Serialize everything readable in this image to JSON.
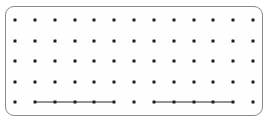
{
  "figure": {
    "title": "",
    "panel": {
      "x": 5,
      "y": 6,
      "width": 258,
      "height": 110,
      "corner_radius": 9,
      "background_color": "#fefefe",
      "border_color": "#8a8a8a",
      "border_width": 1
    },
    "dot_color": "#1c1c1c",
    "dot_size": 3,
    "edge_color": "#2a2a2a",
    "edge_width": 1
  },
  "chart_data": {
    "type": "scatter",
    "title": "",
    "xlabel": "",
    "ylabel": "",
    "grid": false,
    "legend": null,
    "rows": 5,
    "columns": 13,
    "x_start": 15,
    "x_step": 19.83,
    "y_start": 20,
    "y_step": 20.5,
    "points": [
      {
        "row": 1,
        "col": 1,
        "x": 15.0,
        "y": 20
      },
      {
        "row": 1,
        "col": 2,
        "x": 34.8,
        "y": 20
      },
      {
        "row": 1,
        "col": 3,
        "x": 54.7,
        "y": 20
      },
      {
        "row": 1,
        "col": 4,
        "x": 74.5,
        "y": 20
      },
      {
        "row": 1,
        "col": 5,
        "x": 94.3,
        "y": 20
      },
      {
        "row": 1,
        "col": 6,
        "x": 114.2,
        "y": 20
      },
      {
        "row": 1,
        "col": 7,
        "x": 134.0,
        "y": 20
      },
      {
        "row": 1,
        "col": 8,
        "x": 153.8,
        "y": 20
      },
      {
        "row": 1,
        "col": 9,
        "x": 173.6,
        "y": 20
      },
      {
        "row": 1,
        "col": 10,
        "x": 193.5,
        "y": 20
      },
      {
        "row": 1,
        "col": 11,
        "x": 213.3,
        "y": 20
      },
      {
        "row": 1,
        "col": 12,
        "x": 233.1,
        "y": 20
      },
      {
        "row": 1,
        "col": 13,
        "x": 253.0,
        "y": 20
      },
      {
        "row": 2,
        "col": 1,
        "x": 15.0,
        "y": 40.5
      },
      {
        "row": 2,
        "col": 2,
        "x": 34.8,
        "y": 40.5
      },
      {
        "row": 2,
        "col": 3,
        "x": 54.7,
        "y": 40.5
      },
      {
        "row": 2,
        "col": 4,
        "x": 74.5,
        "y": 40.5
      },
      {
        "row": 2,
        "col": 5,
        "x": 94.3,
        "y": 40.5
      },
      {
        "row": 2,
        "col": 6,
        "x": 114.2,
        "y": 40.5
      },
      {
        "row": 2,
        "col": 7,
        "x": 134.0,
        "y": 40.5
      },
      {
        "row": 2,
        "col": 8,
        "x": 153.8,
        "y": 40.5
      },
      {
        "row": 2,
        "col": 9,
        "x": 173.6,
        "y": 40.5
      },
      {
        "row": 2,
        "col": 10,
        "x": 193.5,
        "y": 40.5
      },
      {
        "row": 2,
        "col": 11,
        "x": 213.3,
        "y": 40.5
      },
      {
        "row": 2,
        "col": 12,
        "x": 233.1,
        "y": 40.5
      },
      {
        "row": 2,
        "col": 13,
        "x": 253.0,
        "y": 40.5
      },
      {
        "row": 3,
        "col": 1,
        "x": 15.0,
        "y": 61
      },
      {
        "row": 3,
        "col": 2,
        "x": 34.8,
        "y": 61
      },
      {
        "row": 3,
        "col": 3,
        "x": 54.7,
        "y": 61
      },
      {
        "row": 3,
        "col": 4,
        "x": 74.5,
        "y": 61
      },
      {
        "row": 3,
        "col": 5,
        "x": 94.3,
        "y": 61
      },
      {
        "row": 3,
        "col": 6,
        "x": 114.2,
        "y": 61
      },
      {
        "row": 3,
        "col": 7,
        "x": 134.0,
        "y": 61
      },
      {
        "row": 3,
        "col": 8,
        "x": 153.8,
        "y": 61
      },
      {
        "row": 3,
        "col": 9,
        "x": 173.6,
        "y": 61
      },
      {
        "row": 3,
        "col": 10,
        "x": 193.5,
        "y": 61
      },
      {
        "row": 3,
        "col": 11,
        "x": 213.3,
        "y": 61
      },
      {
        "row": 3,
        "col": 12,
        "x": 233.1,
        "y": 61
      },
      {
        "row": 3,
        "col": 13,
        "x": 253.0,
        "y": 61
      },
      {
        "row": 4,
        "col": 1,
        "x": 15.0,
        "y": 81.5
      },
      {
        "row": 4,
        "col": 2,
        "x": 34.8,
        "y": 81.5
      },
      {
        "row": 4,
        "col": 3,
        "x": 54.7,
        "y": 81.5
      },
      {
        "row": 4,
        "col": 4,
        "x": 74.5,
        "y": 81.5
      },
      {
        "row": 4,
        "col": 5,
        "x": 94.3,
        "y": 81.5
      },
      {
        "row": 4,
        "col": 6,
        "x": 114.2,
        "y": 81.5
      },
      {
        "row": 4,
        "col": 7,
        "x": 134.0,
        "y": 81.5
      },
      {
        "row": 4,
        "col": 8,
        "x": 153.8,
        "y": 81.5
      },
      {
        "row": 4,
        "col": 9,
        "x": 173.6,
        "y": 81.5
      },
      {
        "row": 4,
        "col": 10,
        "x": 193.5,
        "y": 81.5
      },
      {
        "row": 4,
        "col": 11,
        "x": 213.3,
        "y": 81.5
      },
      {
        "row": 4,
        "col": 12,
        "x": 233.1,
        "y": 81.5
      },
      {
        "row": 4,
        "col": 13,
        "x": 253.0,
        "y": 81.5
      },
      {
        "row": 5,
        "col": 1,
        "x": 15.0,
        "y": 102
      },
      {
        "row": 5,
        "col": 2,
        "x": 34.8,
        "y": 102
      },
      {
        "row": 5,
        "col": 3,
        "x": 54.7,
        "y": 102
      },
      {
        "row": 5,
        "col": 4,
        "x": 74.5,
        "y": 102
      },
      {
        "row": 5,
        "col": 5,
        "x": 94.3,
        "y": 102
      },
      {
        "row": 5,
        "col": 6,
        "x": 114.2,
        "y": 102
      },
      {
        "row": 5,
        "col": 7,
        "x": 134.0,
        "y": 102
      },
      {
        "row": 5,
        "col": 8,
        "x": 153.8,
        "y": 102
      },
      {
        "row": 5,
        "col": 9,
        "x": 173.6,
        "y": 102
      },
      {
        "row": 5,
        "col": 10,
        "x": 193.5,
        "y": 102
      },
      {
        "row": 5,
        "col": 11,
        "x": 213.3,
        "y": 102
      },
      {
        "row": 5,
        "col": 12,
        "x": 233.1,
        "y": 102
      },
      {
        "row": 5,
        "col": 13,
        "x": 253.0,
        "y": 102
      }
    ],
    "edges": [
      {
        "row": 5,
        "from_col": 2,
        "to_col": 6,
        "x1": 34.8,
        "x2": 114.2,
        "y": 102
      },
      {
        "row": 5,
        "from_col": 8,
        "to_col": 12,
        "x1": 153.8,
        "x2": 233.1,
        "y": 102
      }
    ],
    "isolated_points": [
      {
        "row": 5,
        "col": 1
      },
      {
        "row": 5,
        "col": 7
      },
      {
        "row": 5,
        "col": 13
      }
    ]
  }
}
